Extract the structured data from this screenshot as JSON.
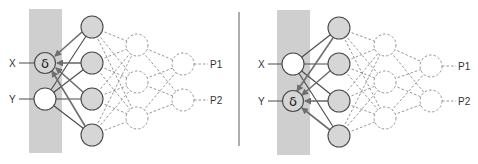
{
  "colors": {
    "band": "#cfcfcf",
    "hidden_fill": "#d6d6d6",
    "node_stroke": "#4a4a4a",
    "arrow": "#6e6e6e",
    "dashed": "#8a8a8a",
    "divider": "#777777"
  },
  "panels": [
    {
      "id": "left",
      "inputs": [
        {
          "label": "X",
          "node_text": "δ",
          "highlighted": true
        },
        {
          "label": "Y",
          "node_text": "",
          "highlighted": false
        }
      ],
      "outputs": [
        "P1",
        "P2"
      ]
    },
    {
      "id": "right",
      "inputs": [
        {
          "label": "X",
          "node_text": "",
          "highlighted": false
        },
        {
          "label": "Y",
          "node_text": "δ",
          "highlighted": true
        }
      ],
      "outputs": [
        "P1",
        "P2"
      ]
    }
  ]
}
